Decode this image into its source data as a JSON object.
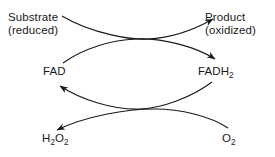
{
  "diagram": {
    "background_color": "#ffffff",
    "stroke_color": "#1a1a1a",
    "text_color": "#1a1a1a",
    "labels": {
      "substrate": {
        "line1": "Substrate",
        "line2": "(reduced)"
      },
      "product": {
        "line1": "Product",
        "line2": "(oxidized)"
      },
      "fad": {
        "text": "FAD"
      },
      "fadh2": {
        "base": "FADH",
        "sub": "2"
      },
      "h2o2": {
        "h": "H",
        "sub1": "2",
        "o": "O",
        "sub2": "2"
      },
      "o2": {
        "base": "O",
        "sub": "2"
      }
    },
    "arrows": [
      {
        "name": "substrate-to-product",
        "from": "Substrate (reduced)",
        "to": "Product (oxidized)"
      },
      {
        "name": "fad-to-fadh2",
        "from": "FAD",
        "to": "FADH2"
      },
      {
        "name": "fadh2-to-fad",
        "from": "FADH2",
        "to": "FAD"
      },
      {
        "name": "o2-to-h2o2",
        "from": "O2",
        "to": "H2O2"
      }
    ]
  }
}
